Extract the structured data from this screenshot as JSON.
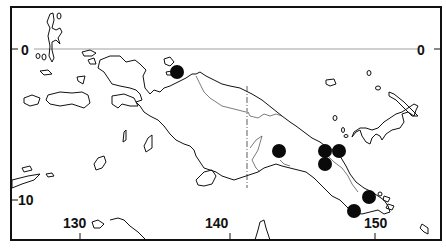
{
  "map": {
    "region": "New Guinea",
    "latitude_labels": [
      {
        "label": "0",
        "side": "left"
      },
      {
        "label": "0",
        "side": "right"
      },
      {
        "label": "10",
        "side": "left"
      }
    ],
    "longitude_labels": [
      {
        "label": "130"
      },
      {
        "label": "140"
      },
      {
        "label": "150"
      }
    ],
    "marker_color": "#0a0a0a",
    "markers": [
      {
        "name": "occurrence-1",
        "x": 177,
        "y": 72
      },
      {
        "name": "occurrence-2",
        "x": 279,
        "y": 151
      },
      {
        "name": "occurrence-3",
        "x": 325,
        "y": 151
      },
      {
        "name": "occurrence-4",
        "x": 339,
        "y": 151
      },
      {
        "name": "occurrence-5",
        "x": 325,
        "y": 164
      },
      {
        "name": "occurrence-6",
        "x": 369,
        "y": 197
      },
      {
        "name": "occurrence-7",
        "x": 354,
        "y": 211
      }
    ]
  }
}
